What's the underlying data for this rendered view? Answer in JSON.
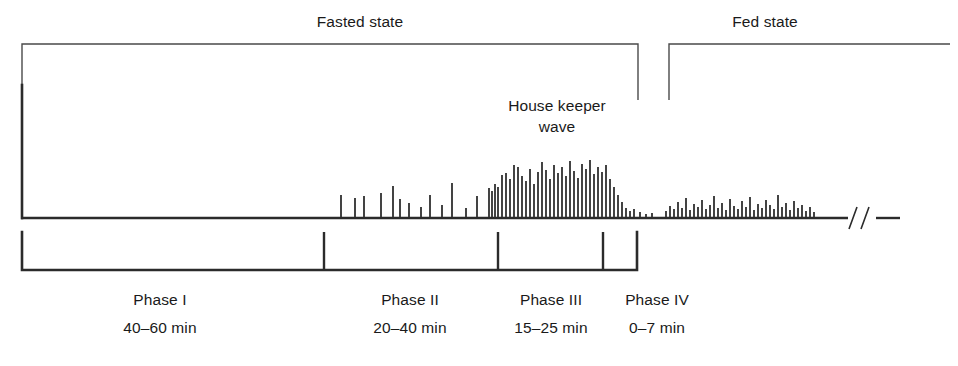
{
  "figure": {
    "title_top_left": "Fasted state",
    "title_top_right": "Fed state",
    "annotation_line1": "House keeper",
    "annotation_line2": "wave",
    "axis_break_symbol": "//",
    "ink_color": "#2b2b2b",
    "background_color": "#ffffff"
  },
  "states": [
    {
      "name": "fasted-state",
      "label": "Fasted state",
      "bracket": {
        "x_start": 22,
        "x_end": 638,
        "y_top": 44,
        "y_bottom": 100
      },
      "label_x": 360,
      "label_y": 12
    },
    {
      "name": "fed-state",
      "label": "Fed state",
      "bracket": {
        "x_start": 669,
        "x_end": 950,
        "y_top": 44,
        "y_bottom": 100
      },
      "label_x": 765,
      "label_y": 12
    }
  ],
  "annotation": {
    "name": "house-keeper-wave",
    "line1": "House keeper",
    "line2": "wave",
    "x": 557,
    "y": 95
  },
  "axes": {
    "y_axis": {
      "x": 22,
      "y_top": 85,
      "y_bottom": 218
    },
    "x_axis": {
      "y": 218,
      "x_start": 22,
      "x_end": 900
    },
    "break": {
      "symbol": "//",
      "x": 858,
      "gap_start": 848,
      "gap_end": 876
    }
  },
  "phase_scale": {
    "name": "phase-scale-bracket",
    "y_line": 270,
    "tick_top": 232,
    "x_start": 22,
    "x_end": 637,
    "tick_positions": [
      324,
      498,
      603
    ]
  },
  "phases": [
    {
      "id": "phase-1",
      "label": "Phase I",
      "duration": "40–60 min",
      "center_x": 160,
      "x_start": 22,
      "x_end": 324
    },
    {
      "id": "phase-2",
      "label": "Phase II",
      "duration": "20–40 min",
      "center_x": 410,
      "x_start": 324,
      "x_end": 498
    },
    {
      "id": "phase-3",
      "label": "Phase III",
      "duration": "15–25 min",
      "center_x": 551,
      "x_start": 498,
      "x_end": 603
    },
    {
      "id": "phase-4",
      "label": "Phase IV",
      "duration": "0–7 min",
      "center_x": 657,
      "x_start": 603,
      "x_end": 637
    }
  ],
  "phase_label_y": 290,
  "phase_duration_y": 318,
  "chart_data": {
    "type": "bar",
    "xlabel": "",
    "ylabel": "",
    "grid": false,
    "legend": "none",
    "baseline_y": 218,
    "xlim": [
      22,
      900
    ],
    "ylim": [
      0,
      133
    ],
    "series": [
      {
        "name": "phase-2-irregular-spikes",
        "color": "#3a3a3a",
        "x": [
          341,
          355,
          364,
          381,
          393,
          400,
          409,
          421,
          430,
          442,
          452,
          466,
          477,
          489
        ],
        "heights": [
          22,
          19,
          21,
          24,
          31,
          18,
          14,
          10,
          22,
          12,
          34,
          9,
          21,
          29
        ]
      },
      {
        "name": "phase-3-housekeeper-wave",
        "color": "#3a3a3a",
        "x": [
          498,
          502,
          506,
          510,
          514,
          518,
          522,
          526,
          530,
          534,
          538,
          542,
          546,
          550,
          554,
          558,
          562,
          566,
          570,
          574,
          578,
          582,
          586,
          590,
          594,
          598,
          602,
          606,
          610,
          614,
          618,
          622,
          626,
          630,
          634
        ],
        "heights": [
          30,
          42,
          44,
          38,
          52,
          50,
          41,
          36,
          48,
          33,
          45,
          55,
          47,
          38,
          52,
          44,
          50,
          41,
          56,
          46,
          39,
          53,
          48,
          57,
          43,
          50,
          45,
          52,
          38,
          30,
          22,
          15,
          9,
          6,
          8
        ]
      },
      {
        "name": "phase-4-low-activity",
        "color": "#3a3a3a",
        "x": [
          640,
          646,
          652
        ],
        "heights": [
          5,
          3,
          4
        ]
      },
      {
        "name": "fed-state-continuous-spikes",
        "color": "#3a3a3a",
        "x": [
          666,
          670,
          674,
          678,
          682,
          686,
          690,
          694,
          698,
          702,
          706,
          710,
          714,
          718,
          722,
          726,
          730,
          734,
          738,
          742,
          746,
          750,
          754,
          758,
          762,
          766,
          770,
          774,
          778,
          782,
          786,
          790,
          794,
          798,
          802,
          806,
          810,
          814
        ],
        "heights": [
          6,
          11,
          8,
          15,
          9,
          19,
          7,
          13,
          10,
          17,
          8,
          12,
          21,
          9,
          14,
          7,
          18,
          11,
          8,
          16,
          10,
          20,
          7,
          13,
          9,
          17,
          12,
          8,
          22,
          10,
          14,
          7,
          16,
          9,
          12,
          6,
          10,
          5
        ]
      },
      {
        "name": "phase-1-2-sparse-precursors",
        "color": "#3a3a3a",
        "x": [
          492,
          495
        ],
        "heights": [
          26,
          33
        ]
      }
    ]
  }
}
